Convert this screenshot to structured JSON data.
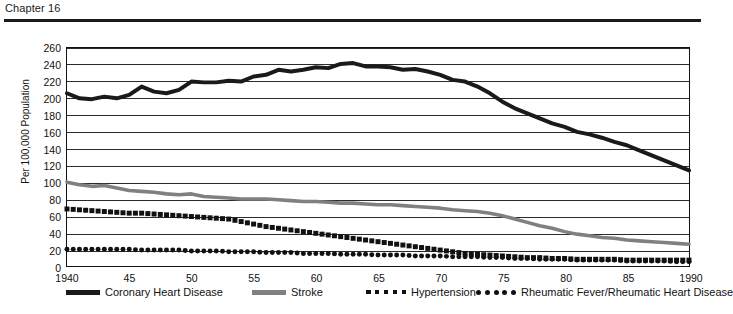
{
  "header": {
    "chapter": "Chapter 16"
  },
  "chart_data": {
    "type": "line",
    "title": "",
    "xlabel": "",
    "ylabel": "Per 100,000 Population",
    "xlim": [
      1940,
      1990
    ],
    "ylim": [
      0,
      260
    ],
    "grid": true,
    "legend_position": "bottom",
    "yticks": [
      0,
      20,
      40,
      60,
      80,
      100,
      120,
      140,
      160,
      180,
      200,
      220,
      240,
      260
    ],
    "xticks": [
      1940,
      1945,
      1950,
      1955,
      1960,
      1965,
      1970,
      1975,
      1980,
      1985,
      1990
    ],
    "xtick_labels": [
      "1940",
      "45",
      "50",
      "55",
      "60",
      "65",
      "70",
      "75",
      "80",
      "85",
      "1990"
    ],
    "x": [
      1940,
      1941,
      1942,
      1943,
      1944,
      1945,
      1946,
      1947,
      1948,
      1949,
      1950,
      1951,
      1952,
      1953,
      1954,
      1955,
      1956,
      1957,
      1958,
      1959,
      1960,
      1961,
      1962,
      1963,
      1964,
      1965,
      1966,
      1967,
      1968,
      1969,
      1970,
      1971,
      1972,
      1973,
      1974,
      1975,
      1976,
      1977,
      1978,
      1979,
      1980,
      1981,
      1982,
      1983,
      1984,
      1985,
      1986,
      1987,
      1988,
      1989,
      1990
    ],
    "series": [
      {
        "name": "Coronary Heart Disease",
        "style": "solid",
        "color": "#1a1a1a",
        "width": 4,
        "values": [
          206,
          200,
          199,
          202,
          200,
          204,
          214,
          208,
          206,
          210,
          220,
          219,
          219,
          221,
          220,
          226,
          228,
          234,
          232,
          234,
          237,
          236,
          241,
          242,
          238,
          238,
          237,
          234,
          235,
          232,
          228,
          222,
          220,
          214,
          206,
          196,
          188,
          182,
          176,
          170,
          166,
          160,
          157,
          153,
          148,
          144,
          138,
          132,
          126,
          120,
          114
        ]
      },
      {
        "name": "Stroke",
        "style": "solid",
        "color": "#808080",
        "width": 3.6,
        "values": [
          100,
          97,
          95,
          96,
          93,
          90,
          89,
          88,
          86,
          85,
          86,
          83,
          82,
          81,
          80,
          80,
          80,
          79,
          78,
          77,
          77,
          76,
          75,
          75,
          74,
          73,
          73,
          72,
          71,
          70,
          69,
          67,
          66,
          65,
          63,
          60,
          56,
          52,
          48,
          45,
          41,
          38,
          36,
          34,
          33,
          31,
          30,
          29,
          28,
          27,
          26
        ]
      },
      {
        "name": "Hypertension",
        "style": "square-dotted",
        "color": "#111111",
        "width": 5,
        "values": [
          68,
          67,
          66,
          65,
          64,
          63,
          63,
          62,
          61,
          60,
          59,
          58,
          57,
          56,
          53,
          50,
          47,
          45,
          43,
          41,
          39,
          37,
          35,
          33,
          31,
          29,
          27,
          25,
          23,
          21,
          19,
          17,
          15,
          14,
          13,
          12,
          11,
          10,
          10,
          9,
          9,
          8,
          8,
          8,
          8,
          7,
          7,
          7,
          7,
          7,
          7
        ]
      },
      {
        "name": "Rheumatic Fever/Rheumatic Heart Disease",
        "style": "round-dotted",
        "color": "#111111",
        "width": 5,
        "values": [
          20,
          20,
          20,
          20,
          20,
          20,
          19,
          19,
          19,
          19,
          18,
          18,
          18,
          17,
          17,
          17,
          16,
          16,
          16,
          15,
          15,
          15,
          14,
          14,
          14,
          13,
          13,
          13,
          12,
          12,
          12,
          11,
          11,
          11,
          10,
          10,
          9,
          9,
          8,
          8,
          8,
          7,
          7,
          7,
          7,
          6,
          6,
          6,
          6,
          5,
          5
        ]
      }
    ],
    "legend": [
      {
        "label": "Coronary Heart Disease",
        "marker": "solid",
        "color": "#1a1a1a"
      },
      {
        "label": "Stroke",
        "marker": "solid",
        "color": "#808080"
      },
      {
        "label": "Hypertension",
        "marker": "square-dotted",
        "color": "#111111"
      },
      {
        "label": "Rheumatic Fever/Rheumatic Heart Disease",
        "marker": "round-dotted",
        "color": "#111111"
      }
    ]
  }
}
